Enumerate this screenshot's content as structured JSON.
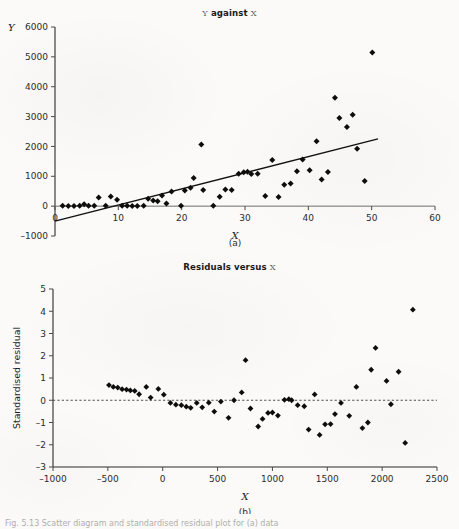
{
  "figure": {
    "caption": "Fig. 5.13  Scatter diagram and standardised residual plot for (a) data",
    "panel_a_letter": "(a)",
    "panel_b_letter": "(b)"
  },
  "chart_data": [
    {
      "type": "scatter",
      "panel": "(a)",
      "title": "Y against X",
      "title_parts": {
        "lead": "Y",
        "mid": " against ",
        "tail": "X"
      },
      "xlabel": "X",
      "ylabel": "Y",
      "xlim": [
        0,
        60
      ],
      "ylim": [
        -1000,
        6000
      ],
      "xticks": [
        0,
        10,
        20,
        30,
        40,
        50,
        60
      ],
      "ytick_labels": [
        "6000",
        "5000",
        "4000",
        "3000",
        "2000",
        "1000",
        "0",
        "-1000"
      ],
      "yticks": [
        6000,
        5000,
        4000,
        3000,
        2000,
        1000,
        0,
        -1000
      ],
      "grid": false,
      "legend": "none",
      "fit_line": {
        "x0": 0,
        "y0": -500,
        "x1": 51,
        "y1": 2250
      },
      "points": [
        [
          1.2,
          10
        ],
        [
          2.1,
          5
        ],
        [
          3.0,
          8
        ],
        [
          3.9,
          12
        ],
        [
          4.6,
          60
        ],
        [
          5.3,
          10
        ],
        [
          6.2,
          15
        ],
        [
          6.9,
          290
        ],
        [
          8.0,
          10
        ],
        [
          8.8,
          320
        ],
        [
          9.8,
          215
        ],
        [
          10.6,
          15
        ],
        [
          11.4,
          10
        ],
        [
          12.2,
          8
        ],
        [
          13.0,
          5
        ],
        [
          14.0,
          10
        ],
        [
          14.7,
          250
        ],
        [
          15.5,
          190
        ],
        [
          16.2,
          165
        ],
        [
          16.9,
          355
        ],
        [
          17.6,
          90
        ],
        [
          18.4,
          490
        ],
        [
          19.9,
          15
        ],
        [
          20.5,
          520
        ],
        [
          21.4,
          620
        ],
        [
          21.9,
          945
        ],
        [
          23.1,
          2065
        ],
        [
          23.4,
          540
        ],
        [
          25.0,
          10
        ],
        [
          26.0,
          315
        ],
        [
          26.9,
          560
        ],
        [
          27.9,
          540
        ],
        [
          29.0,
          1085
        ],
        [
          29.8,
          1135
        ],
        [
          30.4,
          1150
        ],
        [
          31.0,
          1075
        ],
        [
          32.0,
          1085
        ],
        [
          33.2,
          340
        ],
        [
          34.3,
          1545
        ],
        [
          35.3,
          305
        ],
        [
          36.2,
          720
        ],
        [
          37.2,
          755
        ],
        [
          38.2,
          1165
        ],
        [
          39.1,
          1560
        ],
        [
          40.2,
          1205
        ],
        [
          41.3,
          2175
        ],
        [
          42.1,
          895
        ],
        [
          43.1,
          1145
        ],
        [
          44.2,
          3630
        ],
        [
          44.9,
          2955
        ],
        [
          46.1,
          2650
        ],
        [
          47.0,
          3060
        ],
        [
          47.7,
          1925
        ],
        [
          48.9,
          840
        ],
        [
          50.1,
          5145
        ]
      ]
    },
    {
      "type": "scatter",
      "panel": "(b)",
      "title": "Residuals versus X",
      "title_parts": {
        "lead": "Residuals versus ",
        "tail": "X"
      },
      "xlabel": "X",
      "ylabel": "Standardised residual",
      "xlim": [
        -1000,
        2500
      ],
      "ylim": [
        -3,
        5
      ],
      "xticks": [
        -1000,
        -500,
        0,
        500,
        1000,
        1500,
        2000,
        2500
      ],
      "xtick_labels": [
        "-1000",
        "-500",
        "0",
        "500",
        "1000",
        "1500",
        "2000",
        "2500"
      ],
      "yticks": [
        5,
        4,
        3,
        2,
        1,
        0,
        -1,
        -2,
        -3
      ],
      "ytick_labels": [
        "5",
        "4",
        "3",
        "2",
        "1",
        "0",
        "-1",
        "-2",
        "-3"
      ],
      "grid": false,
      "legend": "none",
      "reference_line": {
        "y": 0,
        "style": "dashed"
      },
      "points": [
        [
          -490,
          0.68
        ],
        [
          -450,
          0.6
        ],
        [
          -410,
          0.57
        ],
        [
          -370,
          0.5
        ],
        [
          -330,
          0.48
        ],
        [
          -295,
          0.44
        ],
        [
          -255,
          0.42
        ],
        [
          -215,
          0.27
        ],
        [
          -150,
          0.6
        ],
        [
          -110,
          0.12
        ],
        [
          -40,
          0.51
        ],
        [
          10,
          0.25
        ],
        [
          70,
          -0.12
        ],
        [
          120,
          -0.2
        ],
        [
          170,
          -0.22
        ],
        [
          215,
          -0.29
        ],
        [
          255,
          -0.34
        ],
        [
          310,
          -0.12
        ],
        [
          360,
          -0.32
        ],
        [
          420,
          -0.11
        ],
        [
          470,
          -0.51
        ],
        [
          530,
          -0.06
        ],
        [
          600,
          -0.79
        ],
        [
          650,
          0.0
        ],
        [
          720,
          0.35
        ],
        [
          755,
          1.8
        ],
        [
          800,
          -0.37
        ],
        [
          870,
          -1.18
        ],
        [
          910,
          -0.84
        ],
        [
          960,
          -0.57
        ],
        [
          1000,
          -0.55
        ],
        [
          1050,
          -0.69
        ],
        [
          1110,
          0.02
        ],
        [
          1150,
          0.05
        ],
        [
          1175,
          0.0
        ],
        [
          1230,
          -0.22
        ],
        [
          1290,
          -0.27
        ],
        [
          1330,
          -1.32
        ],
        [
          1385,
          0.26
        ],
        [
          1430,
          -1.56
        ],
        [
          1480,
          -1.08
        ],
        [
          1530,
          -1.07
        ],
        [
          1570,
          -0.62
        ],
        [
          1625,
          -0.12
        ],
        [
          1700,
          -0.7
        ],
        [
          1765,
          0.6
        ],
        [
          1820,
          -1.25
        ],
        [
          1870,
          -1.0
        ],
        [
          1900,
          1.37
        ],
        [
          1940,
          2.35
        ],
        [
          2040,
          0.87
        ],
        [
          2080,
          -0.18
        ],
        [
          2150,
          1.28
        ],
        [
          2210,
          -1.92
        ],
        [
          2280,
          4.07
        ]
      ]
    }
  ]
}
